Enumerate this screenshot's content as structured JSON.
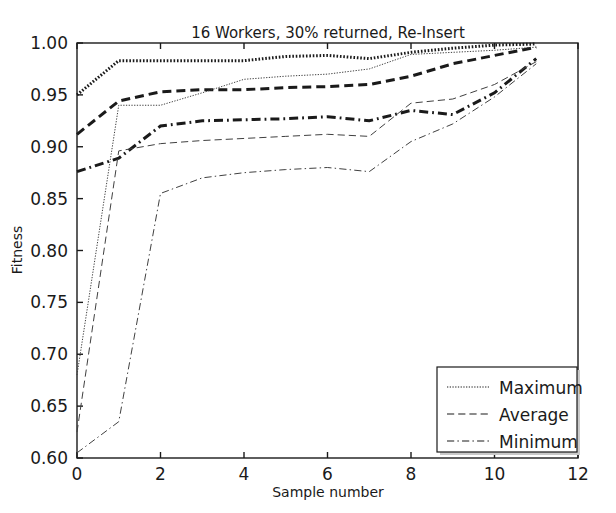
{
  "chart_data": {
    "type": "line",
    "title": "16 Workers, 30% returned, Re-Insert",
    "xlabel": "Sample number",
    "ylabel": "Fitness",
    "xlim": [
      0,
      12
    ],
    "ylim": [
      0.6,
      1.0
    ],
    "xticks": [
      0,
      2,
      4,
      6,
      8,
      10,
      12
    ],
    "xtick_labels": [
      "0",
      "2",
      "4",
      "6",
      "8",
      "10",
      "12"
    ],
    "yticks": [
      0.6,
      0.65,
      0.7,
      0.75,
      0.8,
      0.85,
      0.9,
      0.95,
      1.0
    ],
    "ytick_labels": [
      "0.60",
      "0.65",
      "0.70",
      "0.75",
      "0.80",
      "0.85",
      "0.90",
      "0.95",
      "1.00"
    ],
    "grid": false,
    "legend_position": "lower right",
    "legend_entries": [
      "Maximum",
      "Average",
      "Minimum"
    ],
    "x": [
      0,
      1,
      2,
      3,
      4,
      5,
      6,
      7,
      8,
      9,
      10,
      11
    ],
    "series": [
      {
        "name": "Maximum",
        "group": "thick",
        "style": "dotted",
        "width": 3.0,
        "color": "#1a1a1a",
        "values": [
          0.95,
          0.983,
          0.983,
          0.983,
          0.983,
          0.987,
          0.988,
          0.985,
          0.991,
          0.995,
          0.998,
          0.999
        ]
      },
      {
        "name": "Average",
        "group": "thick",
        "style": "dashed",
        "width": 3.0,
        "color": "#1a1a1a",
        "values": [
          0.912,
          0.944,
          0.953,
          0.955,
          0.955,
          0.957,
          0.958,
          0.96,
          0.968,
          0.98,
          0.988,
          0.996
        ]
      },
      {
        "name": "Minimum",
        "group": "thick",
        "style": "dashdot",
        "width": 3.0,
        "color": "#1a1a1a",
        "values": [
          0.876,
          0.889,
          0.92,
          0.925,
          0.926,
          0.927,
          0.929,
          0.925,
          0.935,
          0.931,
          0.952,
          0.985
        ]
      },
      {
        "name": "Maximum",
        "group": "thin",
        "style": "dotted",
        "width": 1.0,
        "color": "#404040",
        "values": [
          0.68,
          0.94,
          0.94,
          0.952,
          0.965,
          0.968,
          0.97,
          0.975,
          0.989,
          0.991,
          0.993,
          0.996
        ]
      },
      {
        "name": "Average",
        "group": "thin",
        "style": "dashed",
        "width": 1.0,
        "color": "#404040",
        "values": [
          0.625,
          0.896,
          0.903,
          0.906,
          0.908,
          0.91,
          0.912,
          0.91,
          0.942,
          0.946,
          0.96,
          0.982
        ]
      },
      {
        "name": "Minimum",
        "group": "thin",
        "style": "dashdot",
        "width": 1.0,
        "color": "#404040",
        "values": [
          0.605,
          0.635,
          0.855,
          0.87,
          0.875,
          0.878,
          0.88,
          0.876,
          0.905,
          0.922,
          0.948,
          0.98
        ]
      }
    ]
  },
  "figure": {
    "background": "#ffffff",
    "axes_color": "#1a1a1a",
    "plot_box": {
      "left": 77,
      "top": 43,
      "right": 578,
      "bottom": 458
    }
  }
}
